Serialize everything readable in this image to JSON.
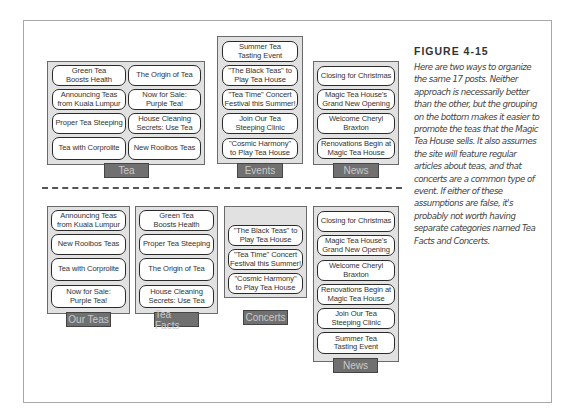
{
  "figure": {
    "title": "FIGURE 4-15",
    "caption": "Here are two ways to organize the same 17 posts. Neither approach is necessarily better than the other, but the grouping on the bottom makes it easier to promote the teas that the Magic Tea House sells. It also assumes the site will feature regular articles about teas, and that concerts are a common type of event. If either of these assumptions are false, it's probably not worth having separate categories named Tea Facts and Concerts."
  },
  "top": {
    "tea": {
      "label": "Tea",
      "posts": [
        "Green Tea\nBoosts Health",
        "The Origin of Tea",
        "Announcing Teas\nfrom Kuala Lumpur",
        "Now for Sale:\nPurple Tea!",
        "Proper Tea Steeping",
        "House Cleaning\nSecrets: Use Tea",
        "Tea with Corprolite",
        "New Rooibos Teas"
      ]
    },
    "events": {
      "label": "Events",
      "posts": [
        "Summer Tea\nTasting Event",
        "\"The Black Teas\" to\nPlay Tea House",
        "\"Tea Time\" Concert\nFestival this Summer!",
        "Join Our Tea\nSteeping Clinic",
        "\"Cosmic Harmony\"\nto Play Tea House"
      ]
    },
    "news": {
      "label": "News",
      "posts": [
        "Closing for Christmas",
        "Magic Tea House's\nGrand New Opening",
        "Welcome Cheryl\nBraxton",
        "Renovations Begin at\nMagic Tea House"
      ]
    }
  },
  "bottom": {
    "our_teas": {
      "label": "Our Teas",
      "posts": [
        "Announcing Teas\nfrom Kuala Lumpur",
        "New Rooibos Teas",
        "Tea with Corprolite",
        "Now for Sale:\nPurple Tea!"
      ]
    },
    "tea_facts": {
      "label": "Tea Facts",
      "posts": [
        "Green Tea\nBoosts Health",
        "Proper Tea Steeping",
        "The Origin of Tea",
        "House Cleaning\nSecrets: Use Tea"
      ]
    },
    "concerts": {
      "label": "Concerts",
      "posts": [
        "\"The Black Teas\" to\nPlay Tea House",
        "\"Tea Time\" Concert\nFestival this Summer!",
        "\"Cosmic Harmony\"\nto Play Tea House"
      ]
    },
    "news": {
      "label": "News",
      "posts": [
        "Closing for Christmas",
        "Magic Tea House's\nGrand New Opening",
        "Welcome Cheryl\nBraxton",
        "Renovations Begin at\nMagic Tea House",
        "Join Our Tea\nSteeping Clinic",
        "Summer Tea\nTasting Event"
      ]
    }
  },
  "colors": {
    "group_fill": "#e1e1e1",
    "tab_fill": "#707070",
    "tab_text": "#c9c9c9"
  }
}
